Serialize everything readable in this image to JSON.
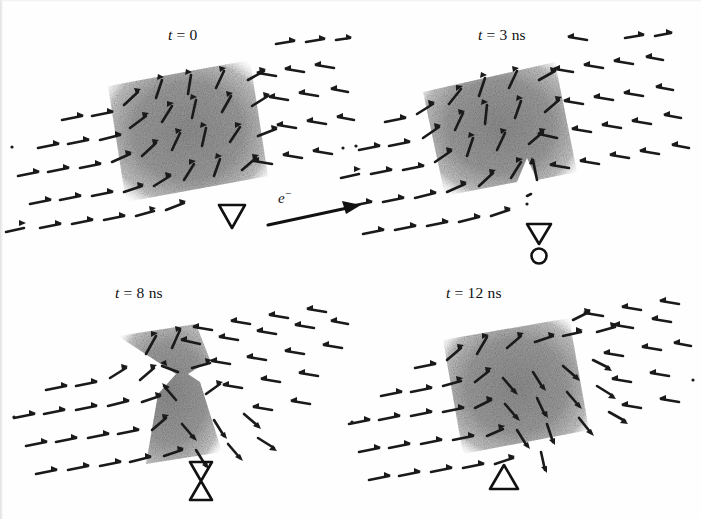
{
  "figure": {
    "type": "micromagnetic-simulation-panels",
    "background_color": "#ffffff",
    "ink_color": "#1a1a1a",
    "band_color": "#969696"
  },
  "panels": [
    {
      "id": "panel-t0",
      "time_label": "t = 0",
      "time_value": 0,
      "time_unit": "ns",
      "symbol": "down-triangle",
      "symbol_name": "transverse-wall-down-triangle",
      "wall_state": "transverse wall, magnetisation rotates upward through the wall"
    },
    {
      "id": "panel-t3",
      "time_label": "t = 3 ns",
      "time_value": 3,
      "time_unit": "ns",
      "symbol": "down-triangle-with-circle",
      "symbol_name": "wall-with-vortex-nucleation",
      "wall_state": "antivortex nucleating at the lower edge of the wall"
    },
    {
      "id": "panel-t8",
      "time_label": "t = 8 ns",
      "time_value": 8,
      "time_unit": "ns",
      "symbol": "hourglass",
      "symbol_name": "pinched-wall-hourglass",
      "wall_state": "wall pinched at the centre, vortex core traversing the strip"
    },
    {
      "id": "panel-t12",
      "time_label": "t = 12 ns",
      "time_value": 12,
      "time_unit": "ns",
      "symbol": "up-triangle",
      "symbol_name": "transverse-wall-up-triangle",
      "wall_state": "transverse wall reformed with reversed chirality, rotates downward"
    }
  ],
  "annotation": {
    "electron_label": "e",
    "electron_superscript": "−",
    "arrow_name": "electron-flow-arrow",
    "arrow_direction": "right",
    "meaning": "direction of electron flow (spin-polarised current)"
  }
}
